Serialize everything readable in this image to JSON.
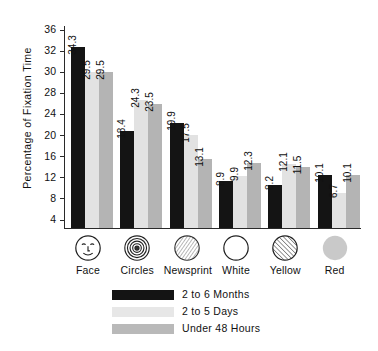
{
  "chart_data": {
    "type": "bar",
    "title": "",
    "xlabel": "",
    "ylabel": "Percentage of Fixation Time",
    "categories": [
      "Face",
      "Circles",
      "Newsprint",
      "White",
      "Yellow",
      "Red"
    ],
    "category_icons": [
      "face-icon",
      "concentric-circles-icon",
      "newsprint-hatch-icon",
      "white-circle-icon",
      "yellow-hatch-circle-icon",
      "red-filled-circle-icon"
    ],
    "series": [
      {
        "name": "2 to 6 Months",
        "color": "#141414",
        "values": [
          34.3,
          18.4,
          19.9,
          8.9,
          8.2,
          10.1
        ]
      },
      {
        "name": "2 to 5 Days",
        "color": "#e2e2e2",
        "values": [
          29.5,
          24.3,
          17.5,
          9.9,
          12.1,
          6.7
        ]
      },
      {
        "name": "Under 48 Hours",
        "color": "#b4b4b4",
        "values": [
          29.5,
          23.5,
          13.1,
          12.3,
          11.5,
          10.1
        ]
      }
    ],
    "ytick_labels": [
      "36",
      "32",
      "30",
      "28",
      "24",
      "20",
      "16",
      "12",
      "8",
      "4"
    ],
    "ytick_values": [
      36,
      32,
      30,
      28,
      24,
      20,
      16,
      12,
      8,
      4
    ],
    "ylim": [
      0,
      38
    ],
    "grid": false,
    "legend_position": "bottom",
    "data_labels": true
  },
  "legend": {
    "items": [
      {
        "label": "2 to 6 Months"
      },
      {
        "label": "2 to 5 Days"
      },
      {
        "label": "Under 48 Hours"
      }
    ]
  }
}
